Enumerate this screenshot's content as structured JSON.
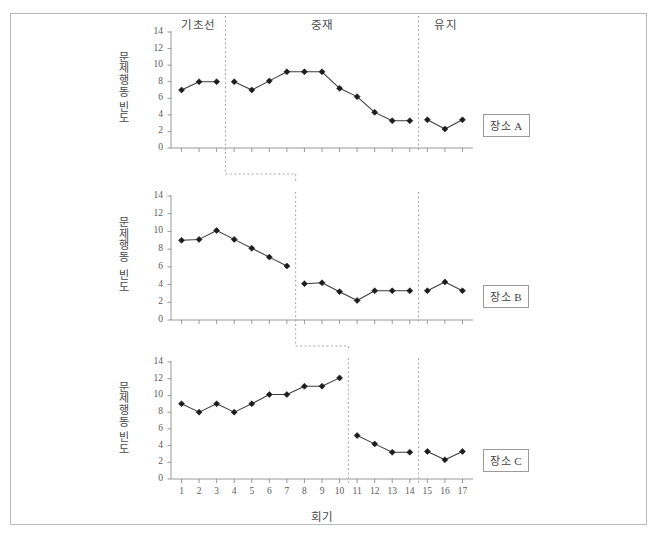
{
  "figure": {
    "xtitle": "회기",
    "ylabel_top": "문제\n행동",
    "ylabel_bottom": "빈\n도",
    "phases": [
      {
        "key": "baseline",
        "label": "기초선"
      },
      {
        "key": "intervention",
        "label": "중재"
      },
      {
        "key": "maintenance",
        "label": "유지"
      }
    ],
    "panel_labels": [
      "장소 A",
      "장소 B",
      "장소 C"
    ],
    "colors": {
      "line": "#3c3c3c",
      "marker": "#1c1c1c",
      "axis": "#8d8d8d",
      "phase_divider": "#9c9c9c",
      "border": "#b9b9b9",
      "text": "#4a4a4a"
    }
  },
  "chart_data": {
    "type": "line",
    "title": "",
    "xlabel": "회기",
    "ylabel": "문제행동 빈도",
    "xlim": [
      0.4,
      17.6
    ],
    "ylim": [
      0,
      14
    ],
    "yticks": [
      0,
      2,
      4,
      6,
      8,
      10,
      12,
      14
    ],
    "xticks": [
      1,
      2,
      3,
      4,
      5,
      6,
      7,
      8,
      9,
      10,
      11,
      12,
      13,
      14,
      15,
      16,
      17
    ],
    "x": [
      1,
      2,
      3,
      4,
      5,
      6,
      7,
      8,
      9,
      10,
      11,
      12,
      13,
      14,
      15,
      16,
      17
    ],
    "grid": false,
    "legend": "none",
    "panels": [
      {
        "name": "장소 A",
        "phase_breaks": [
          3.5,
          14.5
        ],
        "phase_labels": [
          "기초선",
          "중재",
          "유지"
        ],
        "segments": [
          {
            "phase": "기초선",
            "x": [
              1,
              2,
              3
            ],
            "values": [
              7.0,
              8.0,
              8.0
            ]
          },
          {
            "phase": "중재",
            "x": [
              4,
              5,
              6,
              7,
              8,
              9,
              10,
              11,
              12,
              13,
              14
            ],
            "values": [
              8.0,
              7.0,
              8.1,
              9.2,
              9.2,
              9.2,
              7.2,
              6.2,
              4.3,
              3.3,
              3.3
            ]
          },
          {
            "phase": "유지",
            "x": [
              15,
              16,
              17
            ],
            "values": [
              3.4,
              2.3,
              3.4
            ]
          }
        ]
      },
      {
        "name": "장소 B",
        "phase_breaks": [
          7.5,
          14.5
        ],
        "segments": [
          {
            "phase": "기초선",
            "x": [
              1,
              2,
              3,
              4,
              5,
              6,
              7
            ],
            "values": [
              9.0,
              9.1,
              10.1,
              9.1,
              8.1,
              7.1,
              6.1
            ]
          },
          {
            "phase": "중재",
            "x": [
              8,
              9,
              10,
              11,
              12,
              13,
              14
            ],
            "values": [
              4.1,
              4.2,
              3.2,
              2.2,
              3.3,
              3.3,
              3.3
            ]
          },
          {
            "phase": "유지",
            "x": [
              15,
              16,
              17
            ],
            "values": [
              3.3,
              4.3,
              3.3
            ]
          }
        ]
      },
      {
        "name": "장소 C",
        "phase_breaks": [
          10.5,
          14.5
        ],
        "segments": [
          {
            "phase": "기초선",
            "x": [
              1,
              2,
              3,
              4,
              5,
              6,
              7,
              8,
              9,
              10
            ],
            "values": [
              9.0,
              8.0,
              9.0,
              8.0,
              9.0,
              10.1,
              10.1,
              11.1,
              11.1,
              12.1
            ]
          },
          {
            "phase": "중재",
            "x": [
              11,
              12,
              13,
              14
            ],
            "values": [
              5.2,
              4.2,
              3.2,
              3.2
            ]
          },
          {
            "phase": "유지",
            "x": [
              15,
              16,
              17
            ],
            "values": [
              3.3,
              2.3,
              3.3
            ]
          }
        ]
      }
    ]
  }
}
